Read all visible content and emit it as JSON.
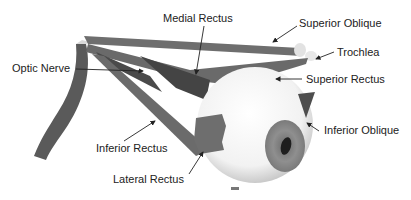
{
  "figure": {
    "labels": {
      "medial_rectus": "Medial Rectus",
      "superior_oblique": "Superior Oblique",
      "trochlea": "Trochlea",
      "optic_nerve": "Optic Nerve",
      "superior_rectus": "Superior Rectus",
      "inferior_oblique": "Inferior Oblique",
      "inferior_rectus": "Inferior Rectus",
      "lateral_rectus": "Lateral Rectus"
    },
    "colors": {
      "muscle": "#6b6b6b",
      "muscle_dark": "#3f3f3f",
      "eyeball": "#f4f4f4",
      "iris": "#8a8a8a",
      "pupil": "#1e1e1e",
      "text": "#222222",
      "leader": "#222222"
    }
  }
}
